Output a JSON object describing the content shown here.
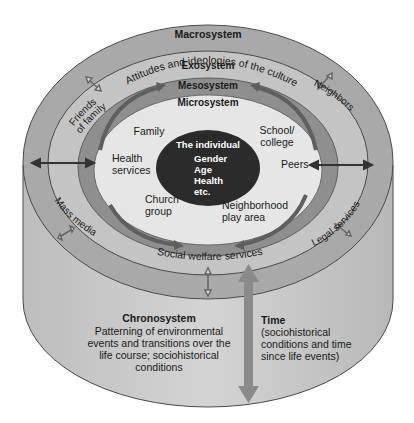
{
  "diagram": {
    "colors": {
      "background": "#ffffff",
      "macro_ring": "#a9a9a9",
      "exo_ring": "#c4c4c4",
      "meso_ring": "#8f8f8f",
      "micro_fill": "#e6e6e6",
      "individual_fill": "#2b2b2b",
      "cylinder_side": "#c9c9c9",
      "outline": "#4a4a4a",
      "arrow_gray": "#6e6e6e"
    },
    "macrosystem": {
      "label": "Macrosystem",
      "description": "Attitudes and ideologies of the culture"
    },
    "exosystem": {
      "label": "Exosystem",
      "items": [
        "Friends of family",
        "Neighbors",
        "Mass media",
        "Legal services",
        "Social welfare services"
      ],
      "friends_line1": "Friends",
      "friends_line2": "of family",
      "neighbors": "Neighbors",
      "mass_media": "Mass media",
      "legal_services": "Legal services",
      "social_welfare": "Social welfare services"
    },
    "mesosystem": {
      "label": "Mesosystem"
    },
    "microsystem": {
      "label": "Microsystem",
      "family": "Family",
      "school_line1": "School/",
      "school_line2": "college",
      "health_line1": "Health",
      "health_line2": "services",
      "peers": "Peers",
      "church_line1": "Church",
      "church_line2": "group",
      "neighborhood_line1": "Neighborhood",
      "neighborhood_line2": "play area"
    },
    "individual": {
      "label": "The individual",
      "attributes": [
        "Gender",
        "Age",
        "Health",
        "etc."
      ]
    },
    "chronosystem": {
      "label": "Chronosystem",
      "lines": [
        "Patterning of environmental",
        "events and transitions over the",
        "life course; sociohistorical",
        "conditions"
      ]
    },
    "time": {
      "label": "Time",
      "lines": [
        "(sociohistorical",
        "conditions and time",
        "since life events)"
      ]
    }
  }
}
